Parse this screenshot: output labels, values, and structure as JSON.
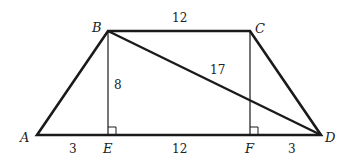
{
  "figure": {
    "type": "trapezoid",
    "points": {
      "A": {
        "label": "A",
        "x": 37,
        "y": 135
      },
      "B": {
        "label": "B",
        "x": 108,
        "y": 31
      },
      "C": {
        "label": "C",
        "x": 250,
        "y": 31
      },
      "D": {
        "label": "D",
        "x": 321,
        "y": 135
      },
      "E": {
        "label": "E",
        "x": 108,
        "y": 135
      },
      "F": {
        "label": "F",
        "x": 250,
        "y": 135
      }
    },
    "measurements": {
      "BC": "12",
      "BE": "8",
      "BD": "17",
      "AE": "3",
      "EF": "12",
      "FD": "3"
    },
    "right_angles": [
      "E",
      "F"
    ],
    "stroke_color": "#1a1a1a"
  }
}
